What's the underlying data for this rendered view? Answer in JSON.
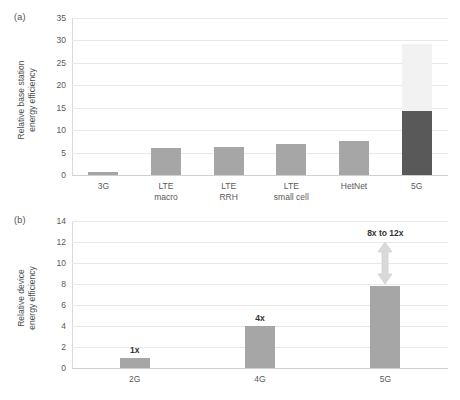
{
  "figure": {
    "background": "#ffffff",
    "panels": [
      {
        "tag": "(a)",
        "ylabel": "Relative base station\nenergy efficiency"
      },
      {
        "tag": "(b)",
        "ylabel": "Relative device\nenergy efficiency"
      }
    ]
  },
  "chart_data": [
    {
      "type": "bar",
      "panel": "(a)",
      "title": "",
      "xlabel": "",
      "ylabel": "Relative base station energy efficiency",
      "categories": [
        "3G",
        "LTE\nmacro",
        "LTE\nRRH",
        "LTE\nsmall cell",
        "HetNet",
        "5G"
      ],
      "values": [
        0.7,
        6.0,
        6.3,
        7.0,
        7.6,
        29.3
      ],
      "stacked": true,
      "series": [
        {
          "name": "base",
          "color": "#a6a6a6",
          "values": [
            0.7,
            6.0,
            6.3,
            7.0,
            7.6,
            14.2
          ]
        },
        {
          "name": "upper range",
          "color": "#f2f2f2",
          "values": [
            0,
            0,
            0,
            0,
            0,
            15.1
          ]
        }
      ],
      "ylim": [
        0,
        35
      ],
      "yticks": [
        0,
        5,
        10,
        15,
        20,
        25,
        30,
        35
      ],
      "grid": true,
      "legend": "none",
      "bar_color": "#a6a6a6",
      "highlight_bar_color": "#595959",
      "highlight_top_color": "#f2f2f2"
    },
    {
      "type": "bar",
      "panel": "(b)",
      "title": "",
      "xlabel": "",
      "ylabel": "Relative device energy efficiency",
      "categories": [
        "2G",
        "4G",
        "5G"
      ],
      "values": [
        1.0,
        4.0,
        7.8
      ],
      "data_labels": [
        "1x",
        "4x",
        ""
      ],
      "ylim": [
        0,
        14
      ],
      "yticks": [
        0,
        2,
        4,
        6,
        8,
        10,
        12,
        14
      ],
      "grid": true,
      "legend": "none",
      "bar_color": "#a6a6a6",
      "annotations": [
        {
          "text": "8x to 12x",
          "category": "5G",
          "from": 8.0,
          "to": 12.0,
          "style": "double-headed-arrow",
          "color": "#d9d9d9"
        }
      ]
    }
  ]
}
